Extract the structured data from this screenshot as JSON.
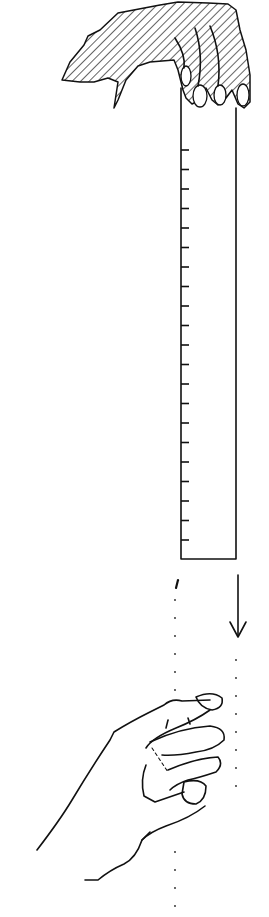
{
  "illustration": {
    "subject": "ruler drop reaction test",
    "ruler": {
      "tick_count": 21,
      "color": "#111111"
    },
    "arrow": {
      "direction": "down"
    },
    "colors": {
      "ink": "#111111",
      "background": "#ffffff"
    }
  }
}
